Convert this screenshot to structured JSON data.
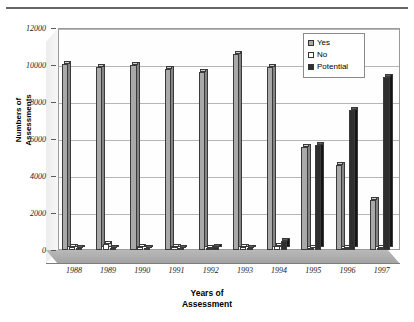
{
  "chart_data": {
    "type": "bar",
    "title": "",
    "subtitle": "",
    "xlabel": "Years of Assessment",
    "ylabel": "Numbers of Assessments",
    "categories": [
      "1988",
      "1989",
      "1990",
      "1991",
      "1992",
      "1993",
      "1994",
      "1995",
      "1996",
      "1997"
    ],
    "series": [
      {
        "name": "Yes",
        "values": [
          10050,
          9900,
          10000,
          9800,
          9600,
          10600,
          9900,
          5550,
          4600,
          2700
        ]
      },
      {
        "name": "No",
        "values": [
          180,
          300,
          150,
          140,
          120,
          170,
          230,
          120,
          110,
          100
        ]
      },
      {
        "name": "Potential",
        "values": [
          110,
          120,
          110,
          110,
          150,
          130,
          470,
          5650,
          7550,
          9350
        ]
      }
    ],
    "ylim": [
      0,
      12000
    ],
    "ytick_values": [
      "12000",
      "10000",
      "8000",
      "6000",
      "4000",
      "2000",
      "0"
    ],
    "ytick_numbers": [
      12000,
      10000,
      8000,
      6000,
      4000,
      2000,
      0
    ],
    "ystep": 2000,
    "grid": true,
    "legend_position": "top-right",
    "style": "3d-clustered-column",
    "colors": {
      "yes": "#a9a9a9",
      "no": "#ffffff",
      "potential": "#2e2e2e",
      "gridline": "#b6b6b6",
      "frame": "#9a9a9a",
      "floor": "#b0b0b0",
      "background": "#ffffff",
      "text": "#000000"
    }
  },
  "axes": {
    "y_title_line1": "Numbers of",
    "y_title_line2": "Assessments",
    "x_title_line1": "Years of",
    "x_title_line2": "Assessment"
  },
  "legend": {
    "items": [
      {
        "label": "Yes",
        "swatch": "legend-swatch-yes"
      },
      {
        "label": "No",
        "swatch": "legend-swatch-no"
      },
      {
        "label": "Potential",
        "swatch": "legend-swatch-potential"
      }
    ]
  }
}
